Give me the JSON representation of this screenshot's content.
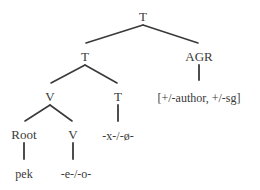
{
  "figure": {
    "type": "syntactic-tree",
    "title": "",
    "ink_color": "#3a3a3a",
    "background_color": "#ffffff"
  },
  "nodes": {
    "t_root": {
      "label": "T",
      "x": 143,
      "y": 10
    },
    "t_mid": {
      "label": "T",
      "x": 85,
      "y": 50
    },
    "agr": {
      "label": "AGR",
      "x": 199,
      "y": 50
    },
    "v_upper": {
      "label": "V",
      "x": 50,
      "y": 90
    },
    "t_lower": {
      "label": "T",
      "x": 118,
      "y": 90
    },
    "root": {
      "label": "Root",
      "x": 24,
      "y": 128
    },
    "v_lower": {
      "label": "V",
      "x": 73,
      "y": 128
    },
    "agr_features": {
      "label": "[+/-author, +/-sg]",
      "x": 199,
      "y": 92
    },
    "t_exponent": {
      "label": "-x-/-ø-",
      "x": 118,
      "y": 130
    },
    "root_exponent": {
      "label": "pek",
      "x": 24,
      "y": 168
    },
    "v_exponent": {
      "label": "-e-/-o-",
      "x": 76,
      "y": 168
    }
  },
  "edges": [
    {
      "name": "t-root-to-t-mid",
      "x1": 143,
      "y1": 25,
      "x2": 86,
      "y2": 43
    },
    {
      "name": "t-root-to-agr",
      "x1": 143,
      "y1": 25,
      "x2": 198,
      "y2": 43
    },
    {
      "name": "t-mid-to-v-upper",
      "x1": 85,
      "y1": 65,
      "x2": 51,
      "y2": 83
    },
    {
      "name": "t-mid-to-t-lower",
      "x1": 85,
      "y1": 65,
      "x2": 117,
      "y2": 83
    },
    {
      "name": "v-upper-to-root",
      "x1": 50,
      "y1": 105,
      "x2": 25,
      "y2": 121
    },
    {
      "name": "v-upper-to-v-lower",
      "x1": 50,
      "y1": 105,
      "x2": 72,
      "y2": 121
    },
    {
      "name": "agr-to-features",
      "x1": 199,
      "y1": 65,
      "x2": 199,
      "y2": 80
    },
    {
      "name": "t-lower-to-exponent",
      "x1": 118,
      "y1": 105,
      "x2": 118,
      "y2": 121
    },
    {
      "name": "root-to-exponent",
      "x1": 24,
      "y1": 143,
      "x2": 24,
      "y2": 159
    },
    {
      "name": "v-lower-to-exponent",
      "x1": 73,
      "y1": 143,
      "x2": 73,
      "y2": 159
    }
  ]
}
